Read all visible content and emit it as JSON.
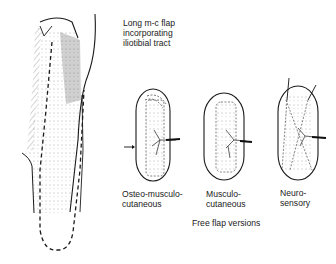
{
  "title": {
    "lines": [
      "Long m-c flap",
      "incorporating",
      "iliotibial tract"
    ]
  },
  "flaps": [
    {
      "id": "osteo-musculo-cutaneous",
      "label_lines": [
        "Osteo-musculo-",
        "cutaneous"
      ]
    },
    {
      "id": "musculo-cutaneous",
      "label_lines": [
        "Musculo-",
        "cutaneous"
      ]
    },
    {
      "id": "neuro-sensory",
      "label_lines": [
        "Neuro-",
        "sensory"
      ]
    }
  ],
  "caption": "Free flap versions",
  "colors": {
    "ink": "#1a1a1a",
    "background": "#ffffff"
  }
}
